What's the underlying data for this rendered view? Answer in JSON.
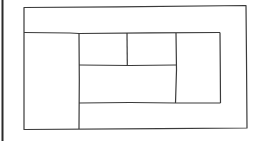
{
  "diagram": {
    "type": "rectangle-subdivision",
    "stroke_color": "#3a3a3a",
    "edge_bar_color": "#2a2a2a",
    "background": "#ffffff",
    "outer_frame": {
      "x1": 24,
      "y1": 7,
      "x2": 246,
      "y2": 128
    },
    "segments": [
      {
        "name": "top-band-divider",
        "x1": 24,
        "y1": 33,
        "x2": 220,
        "y2": 33
      },
      {
        "name": "left-column-divider",
        "x1": 79,
        "y1": 33,
        "x2": 79,
        "y2": 128
      },
      {
        "name": "inner-top-split",
        "x1": 127,
        "y1": 33,
        "x2": 127,
        "y2": 65
      },
      {
        "name": "inner-middle-divider",
        "x1": 79,
        "y1": 65,
        "x2": 176,
        "y2": 65
      },
      {
        "name": "inner-right-split",
        "x1": 176,
        "y1": 33,
        "x2": 176,
        "y2": 103
      },
      {
        "name": "inner-bottom-divider",
        "x1": 79,
        "y1": 103,
        "x2": 220,
        "y2": 103
      },
      {
        "name": "inner-right-edge",
        "x1": 220,
        "y1": 33,
        "x2": 220,
        "y2": 103
      }
    ]
  }
}
